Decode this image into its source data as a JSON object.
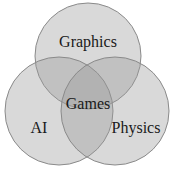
{
  "diagram": {
    "type": "venn",
    "sets": [
      {
        "label": "Graphics",
        "cx": 88,
        "cy": 56,
        "r": 53
      },
      {
        "label": "AI",
        "cx": 59,
        "cy": 111,
        "r": 54
      },
      {
        "label": "Physics",
        "cx": 115,
        "cy": 111,
        "r": 54
      }
    ],
    "center_label": "Games",
    "colors": {
      "fill": "#9a9a9a",
      "stroke": "#8a8a8a",
      "background": "#ffffff"
    }
  }
}
